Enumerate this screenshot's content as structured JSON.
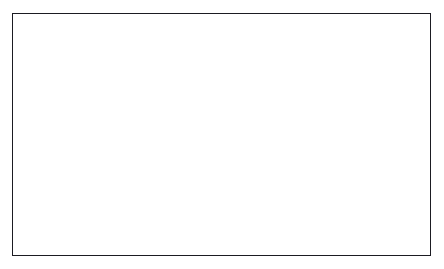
{
  "chart_data": {
    "type": "line",
    "title": "",
    "subtitle": "",
    "xlabel": "",
    "ylabel": "",
    "categories": [
      "2002",
      "2003",
      "2004",
      "2005",
      "2006",
      "2007",
      "2008",
      "2009",
      "2010",
      "2011",
      "2012",
      "2013",
      "2014",
      "2015"
    ],
    "ylim": [
      0,
      20
    ],
    "ytick_step": 2,
    "yticks": [
      "0",
      "2",
      "4",
      "6",
      "8",
      "10",
      "12",
      "14",
      "16",
      "18",
      "20"
    ],
    "grid": "horizontal",
    "legend_position": "bottom",
    "series": [
      {
        "name": "Base case",
        "marker": "triangle",
        "values": [
          14.5,
          14.9,
          15.4,
          15.75,
          15.9,
          16.2,
          16.35,
          16.7,
          16.8,
          16.9,
          17.1,
          17.15,
          17.3,
          17.4
        ]
      },
      {
        "name": "Infrastructure only",
        "marker": "diamond",
        "values": [
          14.5,
          12.3,
          12.6,
          12.85,
          12.85,
          12.85,
          12.5,
          17.0,
          17.2,
          17.4,
          17.7,
          18.0,
          18.2,
          18.6
        ]
      },
      {
        "name": "Full MDGs",
        "marker": "square",
        "values": [
          14.5,
          10.5,
          10.4,
          9.9,
          9.3,
          8.6,
          7.7,
          10.8,
          10.15,
          9.4,
          8.85,
          8.25,
          7.8,
          7.2
        ]
      }
    ],
    "colors": {
      "line": "#15151b",
      "grid": "#8d8d95",
      "axis": "#15151b",
      "background": "#ffffff",
      "frame": "#1b1b22"
    }
  },
  "legend": {
    "items": [
      {
        "label": "Base case",
        "marker": "triangle"
      },
      {
        "label": "Infrastructure only",
        "marker": "diamond"
      },
      {
        "label": "Full MDGs",
        "marker": "square"
      }
    ]
  }
}
